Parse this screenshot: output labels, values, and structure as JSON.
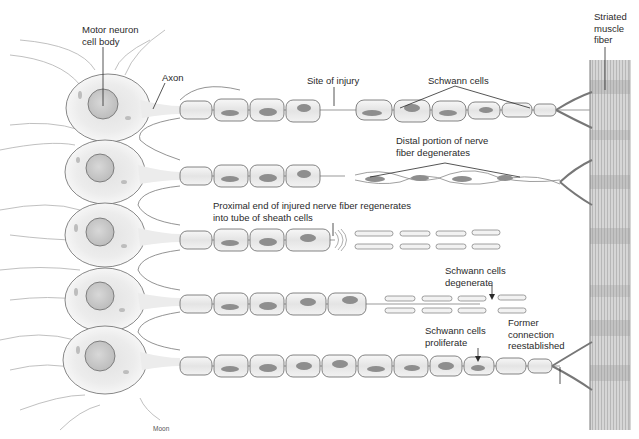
{
  "figure": {
    "credit": "Moon"
  },
  "labels": {
    "motor_neuron": [
      "Motor neuron",
      "cell body"
    ],
    "axon": [
      "Axon"
    ],
    "site_of_injury": [
      "Site of injury"
    ],
    "schwann_cells": [
      "Schwann cells"
    ],
    "striated_muscle": [
      "Striated",
      "muscle",
      "fiber"
    ],
    "distal_degenerates": [
      "Distal portion of nerve",
      "fiber degenerates"
    ],
    "proximal_regenerates": [
      "Proximal end of injured nerve fiber regenerates",
      "into tube of sheath cells"
    ],
    "schwann_degenerate": [
      "Schwann cells",
      "degenerate"
    ],
    "schwann_proliferate": [
      "Schwann cells",
      "proliferate"
    ],
    "former_connection": [
      "Former",
      "connection",
      "reestablished"
    ]
  },
  "stages": [
    {
      "row": 1,
      "description": "Intact fiber with site of injury"
    },
    {
      "row": 2,
      "description": "Distal portion degenerates"
    },
    {
      "row": 3,
      "description": "Proximal end regenerates into sheath tube"
    },
    {
      "row": 4,
      "description": "Schwann cells degenerate"
    },
    {
      "row": 5,
      "description": "Schwann cells proliferate; connection reestablished"
    }
  ],
  "colors": {
    "ink": "#4a4a4a",
    "cell_fill": "#f2f2f2",
    "nucleus": "#cfcfcf",
    "muscle": "#b8b8b8"
  }
}
